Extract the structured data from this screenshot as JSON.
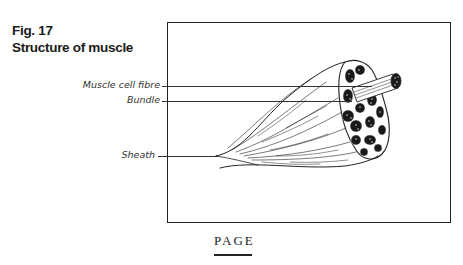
{
  "figure": {
    "number": "Fig. 17",
    "title": "Structure of muscle"
  },
  "diagram": {
    "labels": [
      {
        "id": "muscle_cell_fibre",
        "text": "Muscle cell fibre"
      },
      {
        "id": "bundle",
        "text": "Bundle"
      },
      {
        "id": "sheath",
        "text": "Sheath"
      }
    ]
  },
  "footer": {
    "text": "PAGE"
  }
}
